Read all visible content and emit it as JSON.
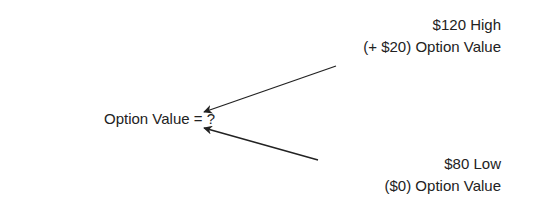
{
  "diagram": {
    "center": {
      "label": "Option Value = ?"
    },
    "high": {
      "price": "$120 High",
      "value": "(+ $20) Option Value"
    },
    "low": {
      "price": "$80 Low",
      "value": "($0) Option Value"
    }
  },
  "colors": {
    "text": "#222222",
    "arrow": "#222222",
    "background": "#ffffff"
  }
}
